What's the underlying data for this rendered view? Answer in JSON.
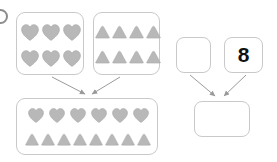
{
  "page": {
    "background_color": "#ffffff",
    "width": 277,
    "height": 162
  },
  "palette": {
    "shape_fill": "#b8b8b8",
    "shape_stroke": "#a8a8a8",
    "box_border": "#c9c9c9",
    "arrow_color": "#9a9a9a",
    "digit_color": "#111111",
    "bullet_stroke": "#8d8d8d"
  },
  "problem": {
    "left_group": {
      "label": "hearts group",
      "shape": "heart",
      "count": 6,
      "rows": [
        {
          "shape": "heart",
          "count": 3
        },
        {
          "shape": "heart",
          "count": 3
        }
      ]
    },
    "right_group": {
      "label": "triangles group",
      "shape": "triangle",
      "count": 8,
      "rows": [
        {
          "shape": "triangle",
          "count": 4
        },
        {
          "shape": "triangle",
          "count": 4
        }
      ]
    },
    "result_group": {
      "label": "combined group",
      "rows": [
        {
          "shape": "heart",
          "count": 6
        },
        {
          "shape": "triangle",
          "count": 8
        }
      ]
    },
    "equation": {
      "addend_1_value": "",
      "addend_1_placeholder": "",
      "addend_2_value": "8",
      "sum_value": "",
      "sum_placeholder": ""
    }
  },
  "arrows": {
    "left_diagram": [
      {
        "name": "arrow-hearts-to-total",
        "from": "hearts-box",
        "to": "result-box"
      },
      {
        "name": "arrow-triangles-to-total",
        "from": "triangles-box",
        "to": "result-box"
      }
    ],
    "right_diagram": [
      {
        "name": "arrow-addend1-to-sum",
        "from": "addend-1-box",
        "to": "sum-box"
      },
      {
        "name": "arrow-addend2-to-sum",
        "from": "addend-2-box",
        "to": "sum-box"
      }
    ]
  },
  "icons": {
    "heart": "heart-icon",
    "triangle": "triangle-icon",
    "bullet": "bullet-circle-icon",
    "arrow": "arrow-down-icon"
  }
}
